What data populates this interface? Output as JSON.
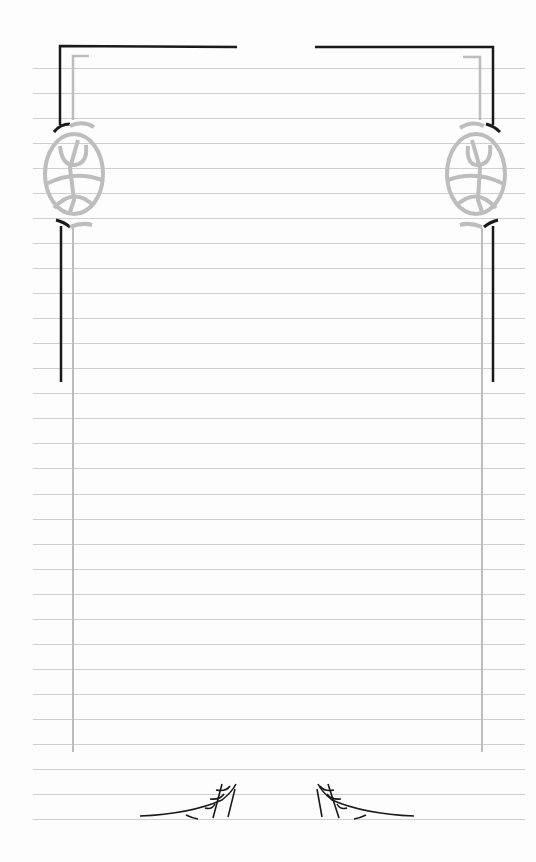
{
  "page": {
    "type": "decorative lined stationery",
    "background_color": "#fdfdfd",
    "rule_color": "#cfcfcf",
    "frame_dark_color": "#1a1a1a",
    "frame_light_color": "#bdbdbd",
    "rules": {
      "count": 31,
      "first_y": 68,
      "spacing": 25.03,
      "x_start": 33,
      "x_end": 525
    },
    "ornaments": {
      "top_left_corner": "bracket-frame",
      "top_right_corner": "bracket-frame",
      "left_medallion": "celtic-oval-knot-icon",
      "right_medallion": "celtic-oval-knot-icon",
      "bottom_left": "spider-web-corner-icon",
      "bottom_right": "spider-web-corner-icon"
    }
  }
}
